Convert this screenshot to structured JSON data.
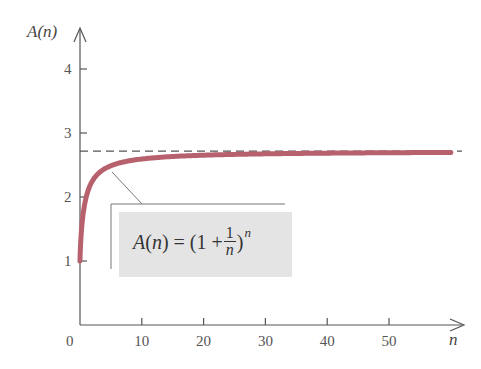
{
  "chart_data": {
    "type": "line",
    "title": "",
    "xlabel": "n",
    "ylabel": "A(n)",
    "xlim": [
      0,
      60
    ],
    "ylim": [
      0,
      4.8
    ],
    "x_ticks": [
      0,
      10,
      20,
      30,
      40,
      50
    ],
    "y_ticks": [
      1,
      2,
      3,
      4
    ],
    "grid": false,
    "series": [
      {
        "name": "A(n) = (1 + 1/n)^n",
        "color": "#b8616e",
        "x": [
          1,
          2,
          3,
          4,
          5,
          6,
          8,
          10,
          15,
          20,
          30,
          40,
          50,
          60
        ],
        "values": [
          2.0,
          2.25,
          2.37,
          2.441,
          2.488,
          2.522,
          2.566,
          2.594,
          2.633,
          2.653,
          2.674,
          2.685,
          2.692,
          2.696
        ]
      }
    ],
    "asymptote": {
      "y": 2.718,
      "style": "dashed",
      "label": "e"
    },
    "annotation": {
      "formula_lhs": "A(n) = (1 + ",
      "frac_num": "1",
      "frac_den": "n",
      "formula_rhs": ")",
      "exponent": "n"
    }
  },
  "labels": {
    "y_axis": "A(n)",
    "x_axis": "n",
    "origin": "0",
    "x_ticks": [
      "10",
      "20",
      "30",
      "40",
      "50"
    ],
    "y_ticks": [
      "1",
      "2",
      "3",
      "4"
    ]
  },
  "colors": {
    "curve": "#b8616e",
    "axis": "#555555",
    "asymptote": "#555555",
    "formula_box": "#e4e4e4"
  }
}
